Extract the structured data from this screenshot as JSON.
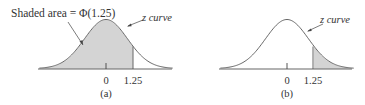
{
  "figure": {
    "panels": [
      {
        "id": "a",
        "caption": "(a)",
        "annotation": "Shaded area = Φ(1.25)",
        "curve_label": "z curve",
        "shading": "left_of_1.25",
        "ticks": [
          {
            "value": 0,
            "label": "0"
          },
          {
            "value": 1.25,
            "label": "1.25"
          }
        ]
      },
      {
        "id": "b",
        "caption": "(b)",
        "curve_label": "z curve",
        "shading": "right_of_1.25",
        "ticks": [
          {
            "value": 0,
            "label": "0"
          },
          {
            "value": 1.25,
            "label": "1.25"
          }
        ]
      }
    ],
    "colors": {
      "curve": "#555555",
      "axis": "#666666",
      "shade": "#d4d4d4",
      "text": "#333333"
    }
  },
  "chart_data": {
    "type": "area",
    "panels": [
      {
        "label": "(a)",
        "distribution": "standard normal",
        "shaded_region": "z < 1.25",
        "area_label": "Shaded area = Φ(1.25)",
        "x_ticks": [
          0,
          1.25
        ]
      },
      {
        "label": "(b)",
        "distribution": "standard normal",
        "shaded_region": "z > 1.25",
        "x_ticks": [
          0,
          1.25
        ]
      }
    ]
  }
}
